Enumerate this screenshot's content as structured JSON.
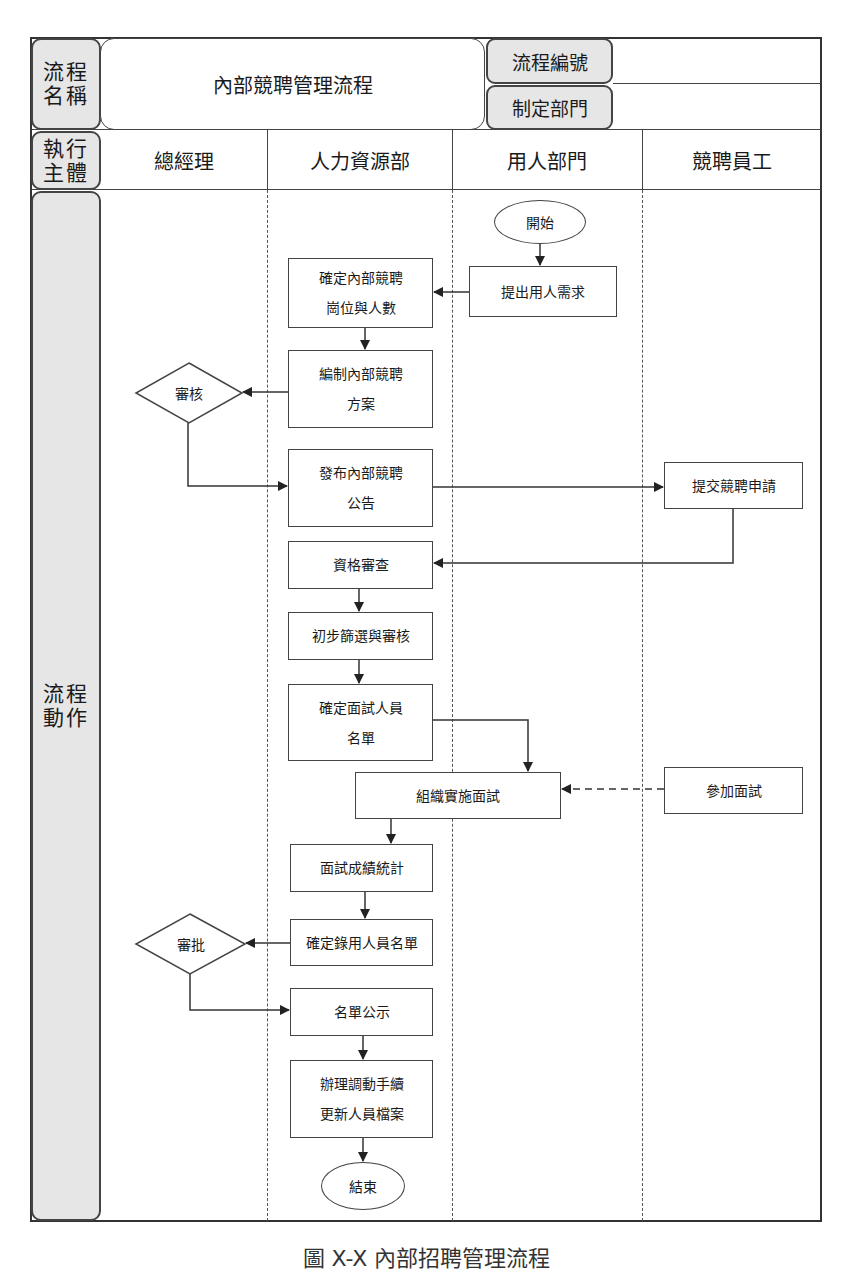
{
  "header": {
    "process_name_label": "流程名稱",
    "process_name_label_lines": [
      "流程",
      "名稱"
    ],
    "process_title": "內部競聘管理流程",
    "process_id_label": "流程編號",
    "process_id_value": "",
    "dept_label": "制定部門",
    "dept_value": "",
    "executor_label_lines": [
      "執行",
      "主體"
    ],
    "action_label_lines": [
      "流程",
      "動作"
    ]
  },
  "lanes": [
    {
      "id": "gm",
      "label": "總經理"
    },
    {
      "id": "hr",
      "label": "人力資源部"
    },
    {
      "id": "dept",
      "label": "用人部門"
    },
    {
      "id": "emp",
      "label": "競聘員工"
    }
  ],
  "nodes": {
    "start": {
      "type": "terminator",
      "lane": "dept",
      "label": "開始"
    },
    "submit_demand": {
      "type": "process",
      "lane": "dept",
      "label": "提出用人需求"
    },
    "confirm_positions": {
      "type": "process",
      "lane": "hr",
      "lines": [
        "確定內部競聘",
        "崗位與人數"
      ]
    },
    "draft_plan": {
      "type": "process",
      "lane": "hr",
      "lines": [
        "編制內部競聘",
        "方案"
      ]
    },
    "review": {
      "type": "decision",
      "lane": "gm",
      "label": "審核"
    },
    "publish_notice": {
      "type": "process",
      "lane": "hr",
      "lines": [
        "發布內部競聘",
        "公告"
      ]
    },
    "submit_application": {
      "type": "process",
      "lane": "emp",
      "label": "提交競聘申請"
    },
    "qualification_check": {
      "type": "process",
      "lane": "hr",
      "label": "資格審查"
    },
    "initial_screening": {
      "type": "process",
      "lane": "hr",
      "label": "初步篩選與審核"
    },
    "confirm_interviewees": {
      "type": "process",
      "lane": "hr",
      "lines": [
        "確定面試人員",
        "名單"
      ]
    },
    "conduct_interview": {
      "type": "process",
      "lane": "hr+dept",
      "label": "組織實施面試"
    },
    "attend_interview": {
      "type": "process",
      "lane": "emp",
      "label": "參加面試"
    },
    "score_stats": {
      "type": "process",
      "lane": "hr",
      "label": "面試成績統計"
    },
    "confirm_hires": {
      "type": "process",
      "lane": "hr",
      "label": "確定錄用人員名單"
    },
    "approve": {
      "type": "decision",
      "lane": "gm",
      "label": "審批"
    },
    "publish_list": {
      "type": "process",
      "lane": "hr",
      "label": "名單公示"
    },
    "transfer_procedures": {
      "type": "process",
      "lane": "hr",
      "lines": [
        "辦理調動手續",
        "更新人員檔案"
      ]
    },
    "end": {
      "type": "terminator",
      "lane": "hr",
      "label": "結束"
    }
  },
  "edges": [
    {
      "from": "start",
      "to": "submit_demand",
      "style": "solid"
    },
    {
      "from": "submit_demand",
      "to": "confirm_positions",
      "style": "solid"
    },
    {
      "from": "confirm_positions",
      "to": "draft_plan",
      "style": "solid"
    },
    {
      "from": "draft_plan",
      "to": "review",
      "style": "solid"
    },
    {
      "from": "review",
      "to": "publish_notice",
      "style": "solid"
    },
    {
      "from": "publish_notice",
      "to": "submit_application",
      "style": "solid"
    },
    {
      "from": "submit_application",
      "to": "qualification_check",
      "style": "solid"
    },
    {
      "from": "qualification_check",
      "to": "initial_screening",
      "style": "solid"
    },
    {
      "from": "initial_screening",
      "to": "confirm_interviewees",
      "style": "solid"
    },
    {
      "from": "confirm_interviewees",
      "to": "conduct_interview",
      "style": "solid"
    },
    {
      "from": "attend_interview",
      "to": "conduct_interview",
      "style": "dashed"
    },
    {
      "from": "conduct_interview",
      "to": "score_stats",
      "style": "solid"
    },
    {
      "from": "score_stats",
      "to": "confirm_hires",
      "style": "solid"
    },
    {
      "from": "confirm_hires",
      "to": "approve",
      "style": "solid"
    },
    {
      "from": "approve",
      "to": "publish_list",
      "style": "solid"
    },
    {
      "from": "publish_list",
      "to": "transfer_procedures",
      "style": "solid"
    },
    {
      "from": "transfer_procedures",
      "to": "end",
      "style": "solid"
    }
  ],
  "caption": "圖 X-X 內部招聘管理流程",
  "colors": {
    "label_fill": "#e6e6e6",
    "line": "#444444",
    "background": "#ffffff"
  }
}
